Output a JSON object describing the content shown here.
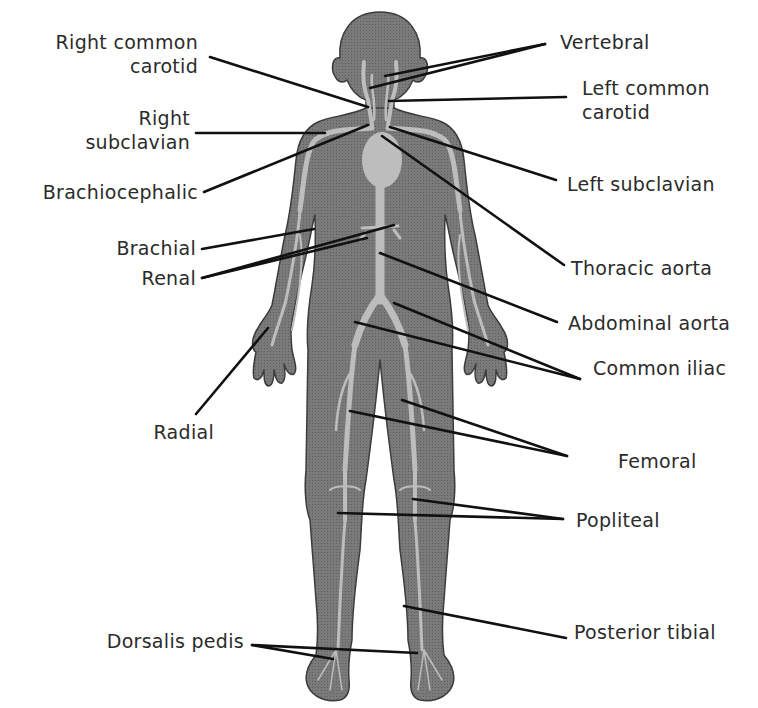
{
  "diagram": {
    "colors": {
      "body_fill": "#7a7a7a",
      "body_outline": "#3c3c3c",
      "vessel": "#bdbdbd",
      "heart": "#bdbdbd",
      "leader_line": "#111111",
      "text": "#2b2b2b",
      "background": "#ffffff"
    },
    "labels_left": [
      {
        "id": "right-common-carotid",
        "lines": [
          "Right common",
          "carotid"
        ]
      },
      {
        "id": "right-subclavian",
        "lines": [
          "Right",
          "subclavian"
        ]
      },
      {
        "id": "brachiocephalic",
        "lines": [
          "Brachiocephalic"
        ]
      },
      {
        "id": "brachial",
        "lines": [
          "Brachial"
        ]
      },
      {
        "id": "renal",
        "lines": [
          "Renal"
        ]
      },
      {
        "id": "radial",
        "lines": [
          "Radial"
        ]
      },
      {
        "id": "dorsalis-pedis",
        "lines": [
          "Dorsalis pedis"
        ]
      }
    ],
    "labels_right": [
      {
        "id": "vertebral",
        "lines": [
          "Vertebral"
        ]
      },
      {
        "id": "left-common-carotid",
        "lines": [
          "Left common",
          "carotid"
        ]
      },
      {
        "id": "left-subclavian",
        "lines": [
          "Left subclavian"
        ]
      },
      {
        "id": "thoracic-aorta",
        "lines": [
          "Thoracic aorta"
        ]
      },
      {
        "id": "abdominal-aorta",
        "lines": [
          "Abdominal aorta"
        ]
      },
      {
        "id": "common-iliac",
        "lines": [
          "Common iliac"
        ]
      },
      {
        "id": "femoral",
        "lines": [
          "Femoral"
        ]
      },
      {
        "id": "popliteal",
        "lines": [
          "Popliteal"
        ]
      },
      {
        "id": "posterior-tibial",
        "lines": [
          "Posterior tibial"
        ]
      }
    ]
  }
}
